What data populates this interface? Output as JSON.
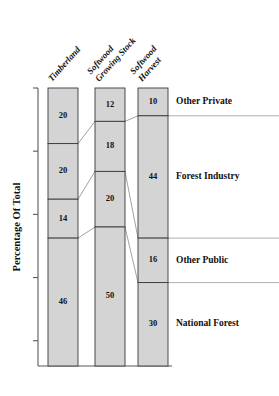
{
  "chart_data": {
    "type": "bar",
    "title": "",
    "subtitle": "",
    "xlabel": "",
    "ylabel": "Percentage Of Total",
    "ylim": [
      0,
      100
    ],
    "grid": false,
    "legend_position": "right-inline-labels",
    "stacked": true,
    "orientation": "vertical",
    "value_unit": "percent",
    "categories": [
      "Timberland",
      "Softwood Growing Stock",
      "Softwood Harvest"
    ],
    "category_header_lines": [
      [
        "Timberland"
      ],
      [
        "Softwood",
        "Growing Stock"
      ],
      [
        "Softwood",
        "Harvest"
      ]
    ],
    "series": [
      {
        "name": "Other Private",
        "values": [
          20,
          12,
          10
        ]
      },
      {
        "name": "Forest Industry",
        "values": [
          20,
          18,
          44
        ]
      },
      {
        "name": "Other Public",
        "values": [
          14,
          20,
          16
        ]
      },
      {
        "name": "National Forest",
        "values": [
          46,
          50,
          30
        ]
      }
    ],
    "series_order_top_to_bottom": [
      "Other Private",
      "Forest Industry",
      "Other Public",
      "National Forest"
    ],
    "axis_ticks": {
      "count": 4,
      "labels": []
    },
    "colors": {
      "bar_fill": "#d4d4d4",
      "bar_stroke": "#3a3a3a",
      "text": "#111111",
      "axis": "#5a5a5a",
      "link_line": "#8a8a8a",
      "background": "#ffffff"
    }
  }
}
